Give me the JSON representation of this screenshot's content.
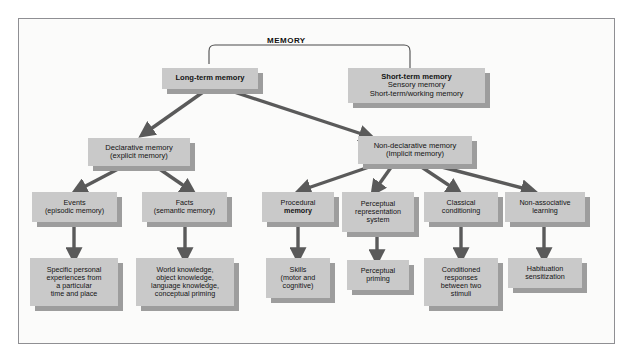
{
  "diagram": {
    "title": "MEMORY",
    "type": "hierarchy-flowchart",
    "colors": {
      "box_fill": "#c9c9c9",
      "box_shadow": "#9d9d9d",
      "arrow": "#5a5a5a",
      "frame_border": "#8f8f93",
      "frame_background": "#fbfbfa",
      "text": "#141414"
    },
    "nodes": {
      "long_term": {
        "line1": "Long-term memory"
      },
      "short_term": {
        "line1": "Short-term memory",
        "line2": "Sensory memory",
        "line3": "Short-term/working memory"
      },
      "declarative": {
        "line1": "Declarative memory",
        "line2": "(explicit memory)"
      },
      "non_declarative": {
        "line1": "Non-declarative memory",
        "line2": "(Implicit memory)"
      },
      "events": {
        "line1": "Events",
        "line2": "(episodic memory)"
      },
      "facts": {
        "line1": "Facts",
        "line2": "(semantic memory)"
      },
      "procedural": {
        "line1": "Procedural",
        "line2": "memory"
      },
      "perceptual_rep": {
        "line1": "Perceptual",
        "line2": "representation",
        "line3": "system"
      },
      "classical": {
        "line1": "Classical",
        "line2": "conditioning"
      },
      "non_associative": {
        "line1": "Non-associative",
        "line2": "learning"
      },
      "events_detail": {
        "line1": "Specific personal",
        "line2": "experiences from",
        "line3": "a particular",
        "line4": "time and place"
      },
      "facts_detail": {
        "line1": "World knowledge,",
        "line2": "object knowledge,",
        "line3": "language knowledge,",
        "line4": "conceptual priming"
      },
      "procedural_detail": {
        "line1": "Skills",
        "line2": "(motor and",
        "line3": "cognitive)"
      },
      "perceptual_detail": {
        "line1": "Perceptual",
        "line2": "priming"
      },
      "classical_detail": {
        "line1": "Conditioned",
        "line2": "responses",
        "line3": "between two",
        "line4": "stimuli"
      },
      "non_associative_detail": {
        "line1": "Habituation",
        "line2": "sensitization"
      }
    }
  }
}
